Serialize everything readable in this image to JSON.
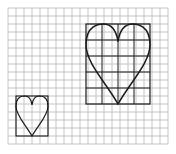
{
  "figure": {
    "colors": {
      "background": "#ffffff",
      "grid_line": "#b8b8b8",
      "outline": "#1a1a1a"
    },
    "grid": {
      "columns": 20,
      "rows": 17
    },
    "small_heart": {
      "box_cells_wide": 4,
      "box_cells_tall": 5,
      "scale": 1
    },
    "large_heart": {
      "box_cells_wide": 8,
      "box_cells_tall": 10,
      "scale": 2,
      "inner_grid_step_cells": 2
    }
  }
}
